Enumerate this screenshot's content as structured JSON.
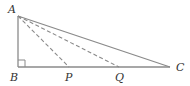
{
  "diagram": {
    "type": "geometry",
    "points": {
      "A": {
        "label": "A",
        "x": 18,
        "y": 16,
        "lx": 8,
        "ly": 13
      },
      "B": {
        "label": "B",
        "x": 18,
        "y": 67,
        "lx": 10,
        "ly": 81
      },
      "P": {
        "label": "P",
        "x": 69,
        "y": 67,
        "lx": 65,
        "ly": 81
      },
      "Q": {
        "label": "Q",
        "x": 119,
        "y": 67,
        "lx": 115,
        "ly": 81
      },
      "C": {
        "label": "C",
        "x": 170,
        "y": 67,
        "lx": 176,
        "ly": 71
      }
    },
    "solid_segments": [
      "AB",
      "BC",
      "AC"
    ],
    "dashed_segments": [
      "AP",
      "AQ"
    ],
    "right_angle_at": "B",
    "colors": {
      "stroke": "#8a8a8a",
      "label": "#333333"
    }
  }
}
